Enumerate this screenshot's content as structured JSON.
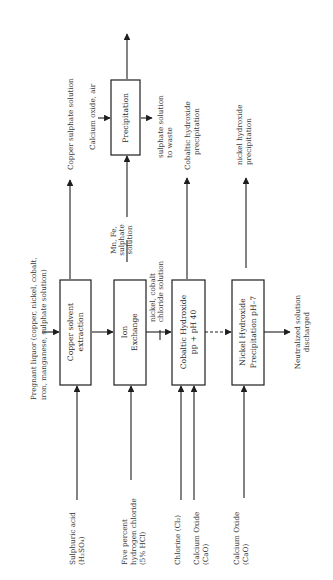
{
  "diagram": {
    "type": "process-flow",
    "orientation": "rotated-90-ccw",
    "colors": {
      "line": "#1e1e1e",
      "text": "#3a3a3a",
      "background": "#ffffff"
    },
    "feed": {
      "line1": "Pregnant liquor (copper, nickel, cobalt,",
      "line2": "iron, manganese, sulphate solution)"
    },
    "boxes": [
      {
        "id": "copper-solvent-extraction",
        "line1": "Copper solvent",
        "line2": "extraction"
      },
      {
        "id": "ion-exchange",
        "line1": "Ion",
        "line2": "Exchange"
      },
      {
        "id": "cobaltic-hydroxide",
        "line1": "Cobaltic Hydroxide",
        "line2": "pp + pH 40"
      },
      {
        "id": "nickel-hydroxide",
        "line1": "Nickel Hydroxide",
        "line2": "Precipitation pH–7"
      },
      {
        "id": "precipitation",
        "line1": "Precipitation",
        "line2": ""
      }
    ],
    "inputs": {
      "sulphuric": {
        "line1": "Sulphuric acid",
        "line2": "(H₂SO₄)"
      },
      "hcl": {
        "line1": "Five percent",
        "line2": "hydrogen chloride",
        "line3": "(5% HCl)"
      },
      "chlorine": {
        "line1": "Chlorine (Cl₂)"
      },
      "cao1": {
        "line1": "Calcium Oxide",
        "line2": "(CaO)"
      },
      "cao2": {
        "line1": "Calcium Oxide",
        "line2": "(CaO)"
      }
    },
    "outputs": {
      "copper": {
        "line1": "Copper sulphate solution"
      },
      "calcium_air": {
        "line1": "Calcium oxide, air"
      },
      "mnfe": {
        "line1": "Mn, Fe,",
        "line2": "sulphate",
        "line3": "solution"
      },
      "to_waste": {
        "line1": "sulphate solution",
        "line2": "to waste"
      },
      "cobaltic": {
        "line1": "Cobaltic hydroxide",
        "line2": "precipitation"
      },
      "nickel": {
        "line1": "nickel hydroxide",
        "line2": "precipitation"
      },
      "nicl": {
        "line1": "nickel, cobalt",
        "line2": "chloride solution"
      },
      "neutralized": {
        "line1": "Neutralized solution",
        "line2": "discharged"
      }
    }
  }
}
